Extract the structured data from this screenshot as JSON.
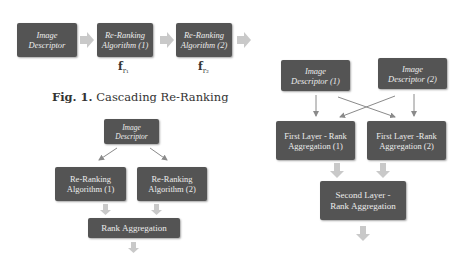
{
  "figure1": {
    "caption_prefix": "Fig. 1.",
    "caption_text": "Cascading Re-Ranking",
    "boxes": [
      {
        "label": "Image\nDescriptor"
      },
      {
        "label": "Re-Ranking\nAlgorithm (1)"
      },
      {
        "label": "Re-Ranking\nAlgorithm (2)"
      }
    ],
    "function_labels": [
      {
        "base": "f",
        "sub": "r₁"
      },
      {
        "base": "f",
        "sub": "r₂"
      }
    ]
  },
  "figure2": {
    "boxes": [
      {
        "label": "Image\nDescriptor"
      },
      {
        "label": "Re-Ranking\nAlgorithm (1)"
      },
      {
        "label": "Re-Ranking\nAlgorithm (2)"
      },
      {
        "label": "Rank Aggregation"
      }
    ]
  },
  "figure3": {
    "boxes": [
      {
        "label": "Image\nDescriptor (1)"
      },
      {
        "label": "Image\nDescriptor (2)"
      },
      {
        "label": "First Layer - Rank\nAggregation (1)"
      },
      {
        "label": "First Layer -Rank\nAggregation (2)"
      },
      {
        "label": "Second Layer -\nRank Aggregation"
      }
    ]
  },
  "colors": {
    "box_fill": "#545454",
    "box_text": "#ececec",
    "block_arrow": "#c9c9c9",
    "line_arrow": "#8a8a8a"
  }
}
